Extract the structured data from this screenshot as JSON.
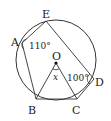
{
  "diagram": {
    "type": "circle-geometry",
    "colors": {
      "stroke": "#333333",
      "background": "#ffffff"
    },
    "circle": {
      "cx": 56,
      "cy": 60,
      "r": 40
    },
    "center": {
      "label": "O",
      "x": 56,
      "y": 63
    },
    "points": {
      "A": {
        "label": "A",
        "x": 22,
        "y": 43
      },
      "B": {
        "label": "B",
        "x": 36,
        "y": 99
      },
      "C": {
        "label": "C",
        "x": 77,
        "y": 99
      },
      "D": {
        "label": "D",
        "x": 94,
        "y": 79
      },
      "E": {
        "label": "E",
        "x": 46,
        "y": 21
      }
    },
    "segments": [
      [
        "E",
        "A"
      ],
      [
        "A",
        "B"
      ],
      [
        "B",
        "C"
      ],
      [
        "E",
        "D"
      ],
      [
        "C",
        "D"
      ],
      [
        "O",
        "B"
      ],
      [
        "O",
        "C"
      ]
    ],
    "angles": {
      "A": {
        "text": "110°"
      },
      "D": {
        "text": "100°"
      },
      "O": {
        "text": "x"
      }
    }
  }
}
